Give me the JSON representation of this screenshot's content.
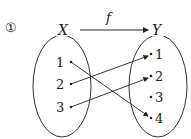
{
  "label": "①",
  "function_name": "f",
  "domain_set": {
    "name": "X",
    "elements": [
      "1",
      "2",
      "3"
    ]
  },
  "codomain_set": {
    "name": "Y",
    "elements": [
      "1",
      "2",
      "3",
      "4"
    ]
  },
  "mappings": [
    {
      "from": "1",
      "to": "4"
    },
    {
      "from": "2",
      "to": "1"
    },
    {
      "from": "3",
      "to": "2"
    }
  ]
}
